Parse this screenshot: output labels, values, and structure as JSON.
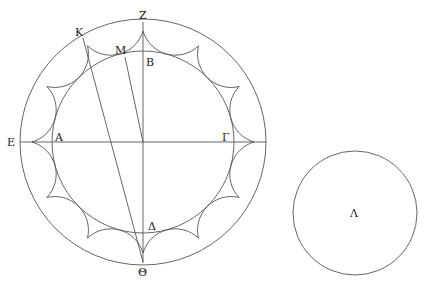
{
  "diagram": {
    "labels": {
      "Z": "Z",
      "K": "K",
      "M": "M",
      "B": "B",
      "E": "E",
      "A": "A",
      "Gamma": "Γ",
      "Delta": "Δ",
      "Theta": "Θ",
      "Lambda": "Λ"
    },
    "colors": {
      "stroke": "#555555",
      "text": "#222222",
      "background": "#ffffff"
    }
  }
}
